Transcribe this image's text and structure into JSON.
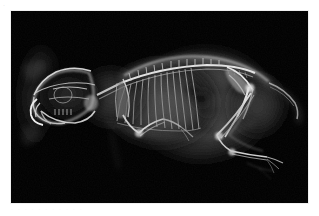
{
  "page": {
    "background_color": "#ffffff",
    "width": 319,
    "height": 216
  },
  "corner_mark": {
    "name": "corner-mark",
    "text": "·"
  },
  "radiograph": {
    "title": "Lateral radiograph of small mammal",
    "frame": {
      "background_color": "#000000",
      "x": 11,
      "y": 11,
      "width": 297,
      "height": 192
    },
    "modality": "X-ray",
    "view": "lateral",
    "subject": "small mammal (rabbit / rodent)",
    "anatomy_labels": [
      "skull",
      "mandible",
      "incisors",
      "cervical spine",
      "thoracic spine",
      "ribcage",
      "scapula",
      "forelimb",
      "abdomen",
      "lumbar spine",
      "pelvis",
      "femur",
      "tibia",
      "hind foot",
      "tail"
    ],
    "tissue_colors": {
      "background": "#000000",
      "soft_tissue_dim": "#1d1d1d",
      "soft_tissue": "#3a3a3a",
      "soft_tissue_bright": "#545454",
      "bone_dim": "#7a7a7a",
      "bone": "#b5b5b5",
      "bone_bright": "#e8e8e8",
      "gas_shadow": "#0e0e0e"
    }
  },
  "caption": {
    "text": "· ·  · ·   ·  · ·    ·  ·   · ·",
    "color": "#f4f4f4"
  }
}
